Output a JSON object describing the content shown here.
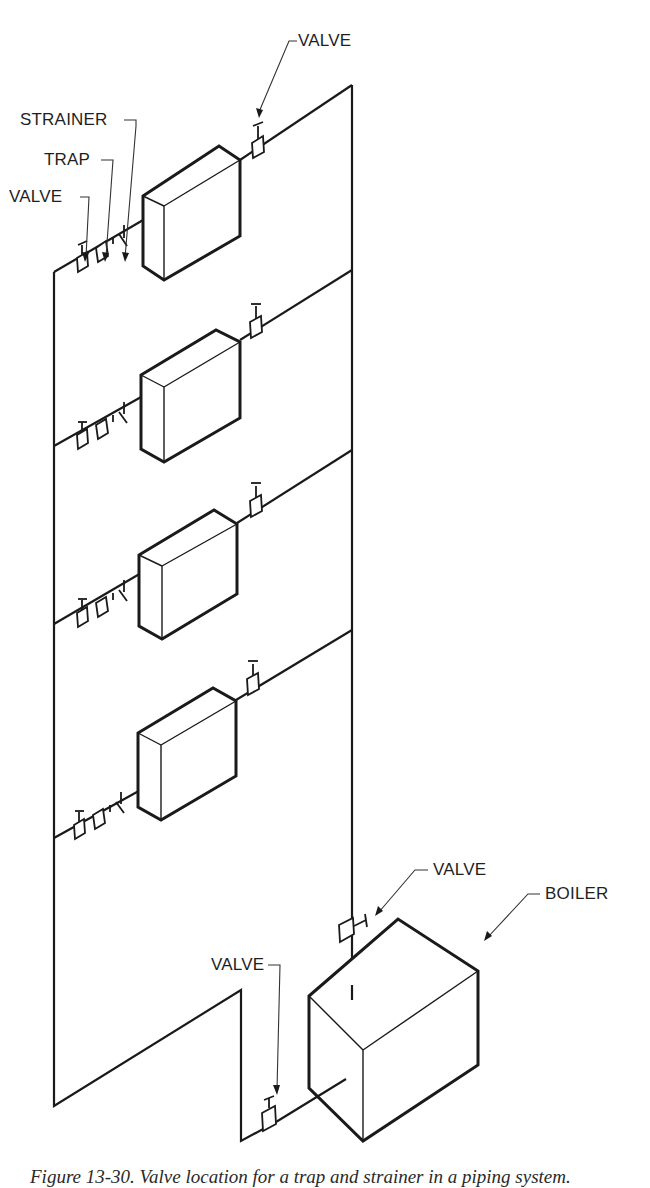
{
  "figure": {
    "type": "isometric piping diagram"
  },
  "labels": {
    "valve_top_supply": "VALVE",
    "strainer": "STRAINER",
    "trap": "TRAP",
    "valve_return": "VALVE",
    "valve_boiler_supply": "VALVE",
    "boiler": "BOILER",
    "valve_boiler_return": "VALVE"
  },
  "components": {
    "radiators": [
      {
        "id": 1,
        "fittings": [
          "valve",
          "trap",
          "strainer",
          "supply valve"
        ]
      },
      {
        "id": 2,
        "fittings": [
          "valve",
          "trap",
          "strainer",
          "supply valve"
        ]
      },
      {
        "id": 3,
        "fittings": [
          "valve",
          "trap",
          "strainer",
          "supply valve"
        ]
      },
      {
        "id": 4,
        "fittings": [
          "valve",
          "trap",
          "strainer",
          "supply valve"
        ]
      }
    ],
    "boiler": {
      "label": "BOILER"
    }
  },
  "caption": "Figure 13-30. Valve location for a trap and strainer in a piping system."
}
